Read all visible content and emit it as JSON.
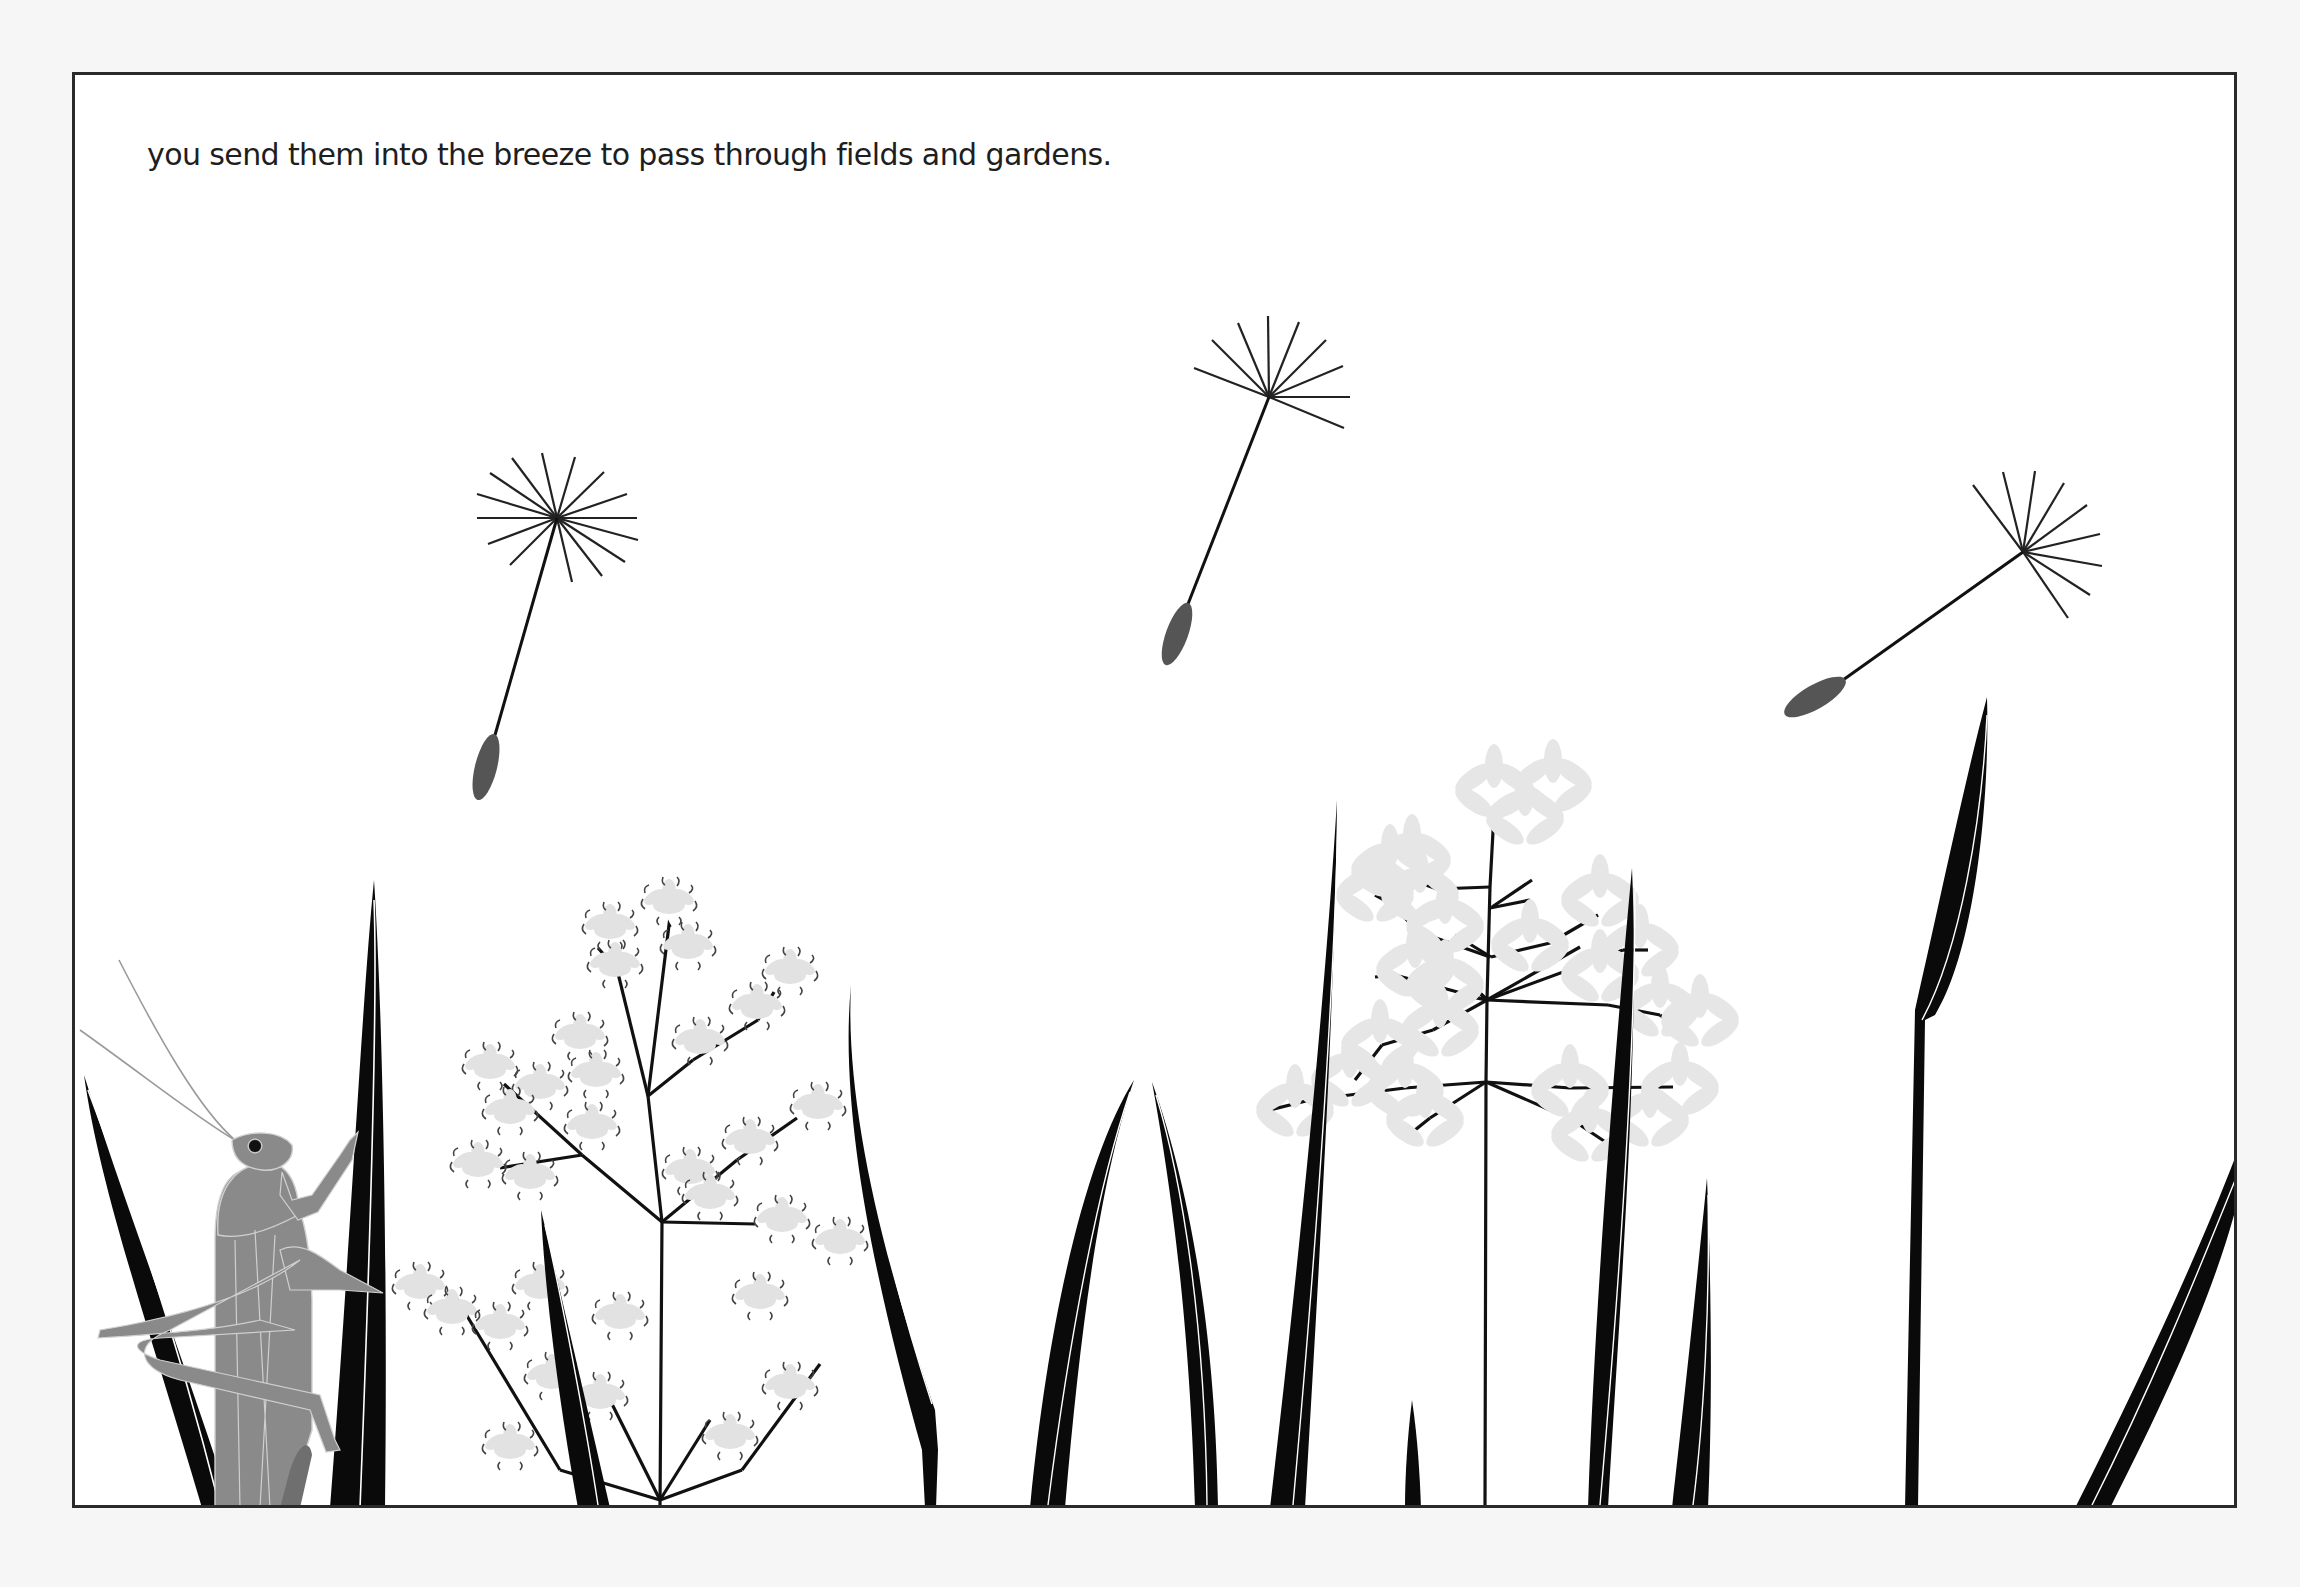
{
  "page": {
    "caption": "you send them into the breeze to pass through fields and gardens.",
    "colors": {
      "background": "#ffffff",
      "frame": "#2a2a2a",
      "grass": "#0a0a0a",
      "grass_stripe": "#ffffff",
      "seed_body": "#555555",
      "grasshopper": "#8a8a8a",
      "florets": "#e2e2e2"
    }
  },
  "illustration": {
    "dandelion_seeds": [
      {
        "name": "seed-left",
        "hub": [
          557,
          518
        ],
        "body": [
          485,
          768
        ]
      },
      {
        "name": "seed-middle",
        "hub": [
          1269,
          397
        ],
        "body": [
          1176,
          633
        ]
      },
      {
        "name": "seed-right",
        "hub": [
          2023,
          552
        ],
        "body": [
          1815,
          697
        ]
      }
    ],
    "subjects": [
      "grasshopper",
      "grass blades",
      "flowering grass plant (left)",
      "flowering grass plant (right)"
    ]
  }
}
